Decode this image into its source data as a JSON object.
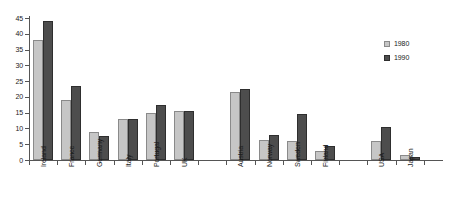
{
  "chart_data": {
    "type": "bar",
    "title": "",
    "subtitle": "",
    "xlabel": "",
    "ylabel": "",
    "ylim": [
      0,
      45
    ],
    "yticks": [
      0,
      5,
      10,
      15,
      20,
      25,
      30,
      35,
      40,
      45
    ],
    "grid": false,
    "legend_position": "right",
    "categories": [
      "Ireland",
      "France",
      "Germany",
      "Italy",
      "Portugal",
      "UK",
      "Austria",
      "Norway",
      "Sweden",
      "Finland",
      "USA",
      "Japan"
    ],
    "group_breaks_after": [
      "UK",
      "Finland"
    ],
    "series": [
      {
        "name": "1980",
        "color": "#c6c6c6",
        "values": [
          38,
          19,
          9,
          13,
          15,
          15.5,
          21.5,
          6.5,
          6,
          3,
          6,
          1.5
        ]
      },
      {
        "name": "1990",
        "color": "#4d4d4d",
        "values": [
          44,
          23.5,
          7.5,
          13,
          17.5,
          15.5,
          22.5,
          8,
          14.5,
          4.5,
          10.5,
          1
        ]
      }
    ]
  },
  "axis": {
    "y_tick_labels": [
      "45",
      "40",
      "35",
      "30",
      "25",
      "20",
      "15",
      "10",
      "5",
      "0"
    ]
  },
  "legend": {
    "entries": [
      {
        "label": "1980"
      },
      {
        "label": "1990"
      }
    ]
  }
}
